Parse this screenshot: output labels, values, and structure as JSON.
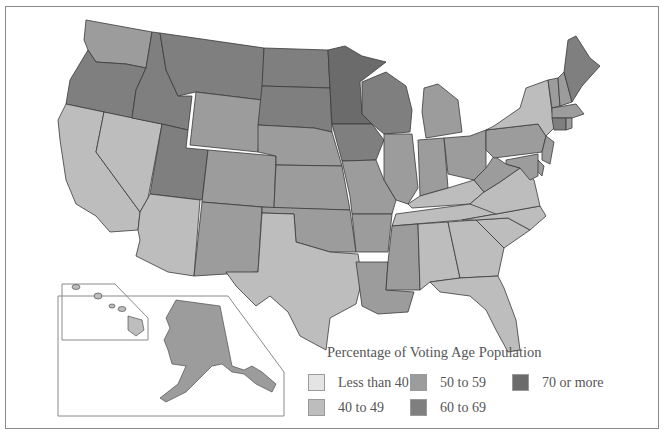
{
  "title": "Percentage of Voting Age Population",
  "colors": {
    "lt40": "#e4e4e4",
    "c40_49": "#bdbdbd",
    "c50_59": "#9c9c9c",
    "c60_69": "#7f7f7f",
    "c70plus": "#6b6b6b",
    "border": "#3a3a3a",
    "frame": "#8a8a8a"
  },
  "legend": {
    "title": "Percentage of Voting Age Population",
    "items": [
      {
        "key": "lt40",
        "label": "Less than 40"
      },
      {
        "key": "c40_49",
        "label": "40 to 49"
      },
      {
        "key": "c50_59",
        "label": "50 to 59"
      },
      {
        "key": "c60_69",
        "label": "60 to 69"
      },
      {
        "key": "c70plus",
        "label": "70 or more"
      }
    ]
  },
  "states": {
    "WA": "50 to 59",
    "OR": "60 to 69",
    "CA": "40 to 49",
    "NV": "40 to 49",
    "ID": "60 to 69",
    "MT": "60 to 69",
    "WY": "50 to 59",
    "UT": "60 to 69",
    "AZ": "40 to 49",
    "CO": "50 to 59",
    "NM": "50 to 59",
    "ND": "60 to 69",
    "SD": "60 to 69",
    "NE": "50 to 59",
    "KS": "50 to 59",
    "OK": "50 to 59",
    "TX": "40 to 49",
    "MN": "70 or more",
    "IA": "60 to 69",
    "MO": "50 to 59",
    "AR": "50 to 59",
    "LA": "50 to 59",
    "WI": "60 to 69",
    "IL": "50 to 59",
    "MI": "50 to 59",
    "IN": "50 to 59",
    "OH": "50 to 59",
    "KY": "40 to 49",
    "TN": "40 to 49",
    "MS": "50 to 59",
    "AL": "40 to 49",
    "GA": "40 to 49",
    "FL": "40 to 49",
    "SC": "40 to 49",
    "NC": "40 to 49",
    "VA": "40 to 49",
    "WV": "50 to 59",
    "PA": "50 to 59",
    "NY": "40 to 49",
    "VT": "50 to 59",
    "NH": "50 to 59",
    "ME": "60 to 69",
    "MA": "50 to 59",
    "CT": "60 to 69",
    "RI": "50 to 59",
    "NJ": "50 to 59",
    "DE": "50 to 59",
    "MD": "50 to 59",
    "AK": "50 to 59",
    "HI": "40 to 49"
  }
}
